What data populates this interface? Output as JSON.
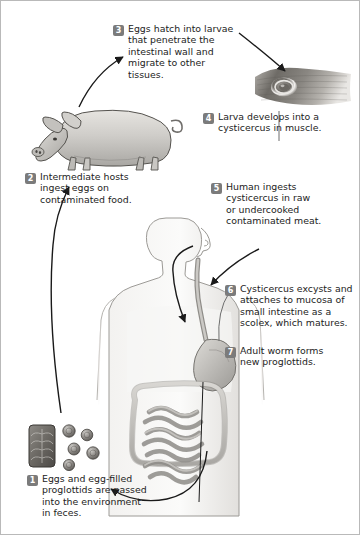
{
  "figure": {
    "background": "#ffffff",
    "border_color": "#b9b9b9",
    "badge_color": "#7b7b7b",
    "badge_text_color": "#ffffff",
    "text_color": "#232323",
    "arrow_color": "#1a1a1a"
  },
  "steps": [
    {
      "number": "1",
      "text": "Eggs and egg-filled\nproglottids are passed\ninto the environment\nin feces.",
      "position": "bottom-left"
    },
    {
      "number": "2",
      "text": "Intermediate hosts\ningest eggs on\ncontaminated food.",
      "position": "mid-left"
    },
    {
      "number": "3",
      "text": "Eggs hatch into larvae\nthat penetrate the\nintestinal wall and\nmigrate to other\ntissues.",
      "position": "top-center"
    },
    {
      "number": "4",
      "text": "Larva develops into a\ncysticercus in muscle.",
      "position": "upper-right"
    },
    {
      "number": "5",
      "text": "Human ingests\ncysticercus in raw\nor undercooked\ncontaminated meat.",
      "position": "right"
    },
    {
      "number": "6",
      "text": "Cysticercus excysts and\nattaches to mucosa of\nsmall intestine as a\nscolex, which matures.",
      "position": "lower-right"
    },
    {
      "number": "7",
      "text": "Adult worm forms\nnew proglottids.",
      "position": "bottom-right"
    }
  ],
  "illustrations": [
    {
      "name": "pig",
      "label": "Pig intermediate host, grayscale drawing, facing left"
    },
    {
      "name": "muscle-cysticercus",
      "label": "Muscle tissue photograph showing a cysticercus cyst"
    },
    {
      "name": "human-figure",
      "label": "Human torso outline with esophagus, stomach and intestines"
    },
    {
      "name": "eggs-proglottid",
      "label": "Tapeworm proglottid segment with egg-filled uterus and loose round eggs"
    }
  ]
}
